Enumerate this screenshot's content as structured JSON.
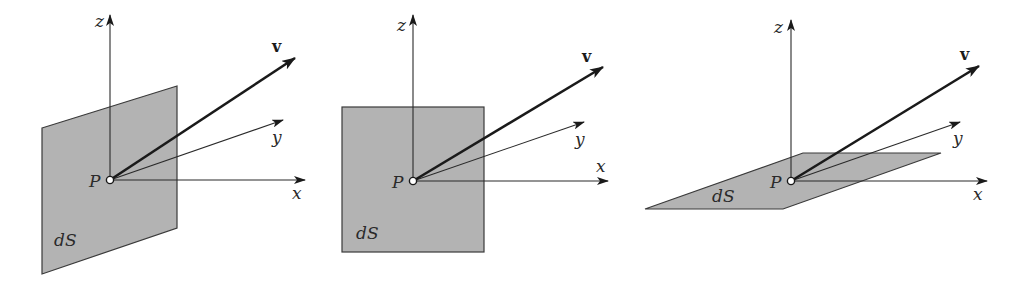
{
  "figure": {
    "colors": {
      "surface_fill": "#b3b3b3",
      "surface_stroke": "#3a3a3a",
      "axis": "#2a2a2a",
      "vector": "#1a1a1a",
      "background": "#ffffff"
    },
    "panels": [
      {
        "id": "panel-1",
        "orientation": "surface perpendicular to x-axis (tilted view)",
        "labels": {
          "z": "z",
          "y": "y",
          "x": "x",
          "v": "v",
          "point": "P",
          "surface": "dS"
        }
      },
      {
        "id": "panel-2",
        "orientation": "surface in the x-z plane (facing viewer)",
        "labels": {
          "z": "z",
          "y": "y",
          "x": "x",
          "v": "v",
          "point": "P",
          "surface": "dS"
        }
      },
      {
        "id": "panel-3",
        "orientation": "surface horizontal (x-y plane)",
        "labels": {
          "z": "z",
          "y": "y",
          "x": "x",
          "v": "v",
          "point": "P",
          "surface": "dS"
        }
      }
    ]
  }
}
